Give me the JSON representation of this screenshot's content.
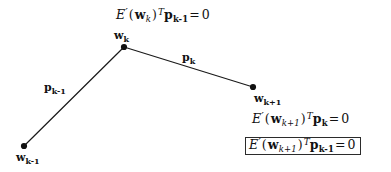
{
  "figure": {
    "type": "conjugate-gradient-line-search-diagram",
    "background_color": "#ffffff",
    "line_color": "#1a1a1a",
    "text_color": "#111111",
    "box_border_color": "#2b2b2b",
    "width": 391,
    "height": 172
  },
  "nodes": [
    {
      "id": "wkm1",
      "label_plain": "w_{k-1}",
      "base": "w",
      "sub": "k-1",
      "x": 24,
      "y": 146,
      "label_x": 16,
      "label_y": 152
    },
    {
      "id": "wk",
      "label_plain": "w_k",
      "base": "w",
      "sub": "k",
      "x": 124,
      "y": 47,
      "label_x": 114,
      "label_y": 30
    },
    {
      "id": "wkp1",
      "label_plain": "w_{k+1}",
      "base": "w",
      "sub": "k+1",
      "x": 253,
      "y": 87,
      "label_x": 254,
      "label_y": 93
    }
  ],
  "segments": [
    {
      "id": "p_km1",
      "from": "wkm1",
      "to": "wk",
      "label_plain": "p_{k-1}",
      "base": "p",
      "sub": "k-1",
      "label_x": 44,
      "label_y": 82
    },
    {
      "id": "p_k",
      "from": "wk",
      "to": "wkp1",
      "label_plain": "p_k",
      "base": "p",
      "sub": "k",
      "label_x": 182,
      "label_y": 52
    }
  ],
  "equations": {
    "top": {
      "plain": "E'(w_k)^T p_{k-1} = 0",
      "func": "E",
      "prime": "′",
      "open_paren": "(",
      "arg_base": "w",
      "arg_sub": "k",
      "close_paren": ")",
      "transpose": "T",
      "vec_base": "p",
      "vec_sub": "k-1",
      "equals": "=",
      "rhs": "0",
      "boxed": false
    },
    "right_upper": {
      "plain": "E'(w_{k+1})^T p_k = 0",
      "func": "E",
      "prime": "′",
      "open_paren": "(",
      "arg_base": "w",
      "arg_sub": "k+1",
      "close_paren": ")",
      "transpose": "T",
      "vec_base": "p",
      "vec_sub": "k",
      "equals": "=",
      "rhs": "0",
      "boxed": false
    },
    "right_lower": {
      "plain": "E'(w_{k+1})^T p_{k-1} = 0",
      "func": "E",
      "prime": "′",
      "open_paren": "(",
      "arg_base": "w",
      "arg_sub": "k+1",
      "close_paren": ")",
      "transpose": "T",
      "vec_base": "p",
      "vec_sub": "k-1",
      "equals": "=",
      "rhs": "0",
      "boxed": true
    }
  }
}
